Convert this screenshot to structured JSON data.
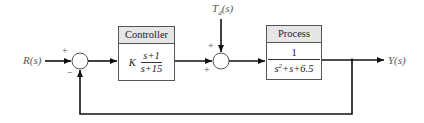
{
  "diagram": {
    "type": "feedback control block diagram",
    "input": {
      "label": "R(s)"
    },
    "output": {
      "label": "Y(s)"
    },
    "disturbance": {
      "label": "T_d(s)",
      "main": "T",
      "sub": "d",
      "arg": "(s)"
    },
    "summing_junction_1": {
      "plus_sign": "+",
      "minus_sign": "−"
    },
    "summing_junction_2": {
      "top_sign": "+",
      "left_sign": "+"
    },
    "controller": {
      "title": "Controller",
      "gain": "K",
      "numerator": "s+1",
      "denominator": "s+15"
    },
    "process": {
      "title": "Process",
      "numerator": "1",
      "denominator_prefix": "s",
      "denominator_power": "2",
      "denominator_suffix": "+s+6.5"
    },
    "colors": {
      "line": "#111111",
      "text": "#555555",
      "header_bg": "#e6e6e6"
    }
  }
}
